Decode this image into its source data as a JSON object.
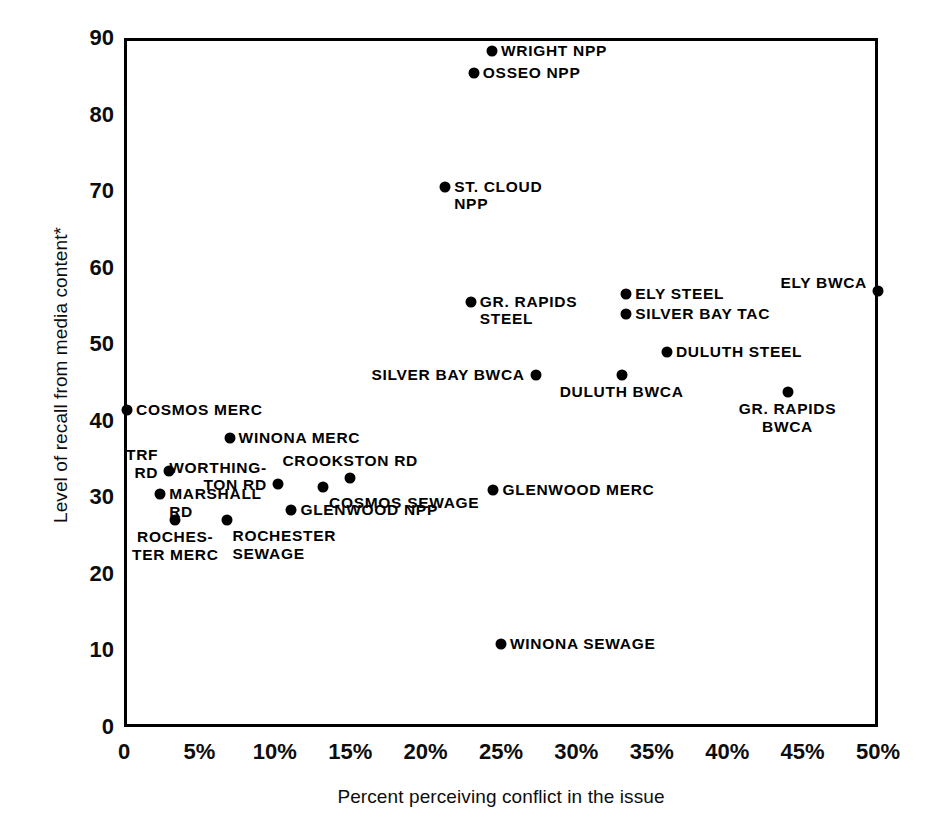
{
  "chart_data": {
    "type": "scatter",
    "title": "",
    "xlabel": "Percent perceiving conflict in the issue",
    "ylabel": "Level of recall from media content*",
    "xlim": [
      0,
      50
    ],
    "ylim": [
      0,
      90
    ],
    "grid": false,
    "legend": "none",
    "xticks": [
      "0",
      "5%",
      "10%",
      "15%",
      "20%",
      "25%",
      "30%",
      "35%",
      "40%",
      "45%",
      "50%"
    ],
    "xtick_values": [
      0,
      5,
      10,
      15,
      20,
      25,
      30,
      35,
      40,
      45,
      50
    ],
    "yticks": [
      "0",
      "10",
      "20",
      "30",
      "40",
      "50",
      "60",
      "70",
      "80",
      "90"
    ],
    "ytick_values": [
      0,
      10,
      20,
      30,
      40,
      50,
      60,
      70,
      80,
      90
    ],
    "points": [
      {
        "label": "WRIGHT NPP",
        "x": 24.4,
        "y": 88.3,
        "pos": "right"
      },
      {
        "label": "OSSEO NPP",
        "x": 23.2,
        "y": 85.4,
        "pos": "right"
      },
      {
        "label": "ST. CLOUD\nNPP",
        "x": 21.3,
        "y": 70.6,
        "pos": "right"
      },
      {
        "label": "ELY BWCA",
        "x": 50.0,
        "y": 57.0,
        "pos": "left-two"
      },
      {
        "label": "ELY STEEL",
        "x": 33.3,
        "y": 56.5,
        "pos": "right"
      },
      {
        "label": "GR. RAPIDS\nSTEEL",
        "x": 23.0,
        "y": 55.5,
        "pos": "right"
      },
      {
        "label": "SILVER BAY TAC",
        "x": 33.3,
        "y": 54.0,
        "pos": "right"
      },
      {
        "label": "DULUTH STEEL",
        "x": 36.0,
        "y": 49.0,
        "pos": "right"
      },
      {
        "label": "DULUTH BWCA",
        "x": 33.0,
        "y": 46.0,
        "pos": "below"
      },
      {
        "label": "SILVER BAY BWCA",
        "x": 27.3,
        "y": 46.0,
        "pos": "left"
      },
      {
        "label": "GR. RAPIDS\nBWCA",
        "x": 44.0,
        "y": 43.7,
        "pos": "below"
      },
      {
        "label": "COSMOS MERC",
        "x": 0.2,
        "y": 41.4,
        "pos": "right"
      },
      {
        "label": "WINONA MERC",
        "x": 7.0,
        "y": 37.8,
        "pos": "right"
      },
      {
        "label": "TRF\nRD",
        "x": 3.0,
        "y": 33.4,
        "pos": "left-two"
      },
      {
        "label": "COSMOS SEWAGE",
        "x": 13.2,
        "y": 31.3,
        "pos": "below-right"
      },
      {
        "label": "CROOKSTON RD",
        "x": 15.0,
        "y": 32.5,
        "pos": "above"
      },
      {
        "label": "WORTHING-\nTON RD",
        "x": 10.2,
        "y": 31.8,
        "pos": "left-two"
      },
      {
        "label": "GLENWOOD MERC",
        "x": 24.5,
        "y": 31.0,
        "pos": "right"
      },
      {
        "label": "MARSHALL\nRD",
        "x": 2.4,
        "y": 30.4,
        "pos": "right"
      },
      {
        "label": "GLENWOOD NPP",
        "x": 11.1,
        "y": 28.4,
        "pos": "right"
      },
      {
        "label": "ROCHES-\nTER MERC",
        "x": 3.4,
        "y": 27.0,
        "pos": "below"
      },
      {
        "label": "ROCHESTER\nSEWAGE",
        "x": 6.8,
        "y": 27.0,
        "pos": "below-right"
      },
      {
        "label": "WINONA SEWAGE",
        "x": 25.0,
        "y": 10.9,
        "pos": "right"
      }
    ]
  }
}
